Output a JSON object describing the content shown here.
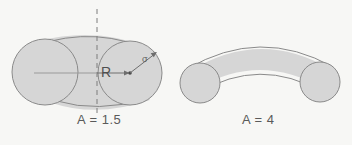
{
  "figure": {
    "title": "",
    "background_color": "#f7f7f5",
    "shape_fill": "#d6d6d6",
    "stroke_color": "#8a8a8a",
    "panels": [
      {
        "name": "panel-left",
        "label": "A = 1.5",
        "aspect_value": "1.5",
        "symmetry_axis": "dashed-vertical",
        "annotations": [
          {
            "name": "radius-label",
            "text": "R",
            "meaning": "sphere-radius"
          },
          {
            "name": "sigma-label",
            "text": "σ",
            "meaning": "interaction-diameter"
          }
        ],
        "circles": [
          {
            "name": "left-sphere",
            "cx": 45,
            "cy": 72,
            "r": 33
          },
          {
            "name": "right-sphere",
            "cx": 130,
            "cy": 73,
            "r": 32
          }
        ]
      },
      {
        "name": "panel-right",
        "label": "A = 4",
        "aspect_value": "4",
        "symmetry_axis": "none",
        "annotations": [],
        "circles": [
          {
            "name": "left-sphere",
            "cx": 200,
            "cy": 83,
            "r": 20
          },
          {
            "name": "right-sphere",
            "cx": 320,
            "cy": 82,
            "r": 20
          }
        ]
      }
    ]
  }
}
